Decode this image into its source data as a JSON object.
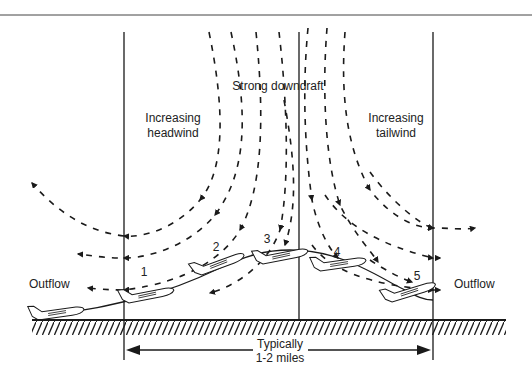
{
  "labels": {
    "title_center": "Strong downdraft",
    "left_zone_line1": "Increasing",
    "left_zone_line2": "headwind",
    "right_zone_line1": "Increasing",
    "right_zone_line2": "tailwind",
    "outflow_left": "Outflow",
    "outflow_right": "Outflow",
    "distance_line1": "Typically",
    "distance_line2": "1-2 miles"
  },
  "aircraft_positions": [
    "1",
    "2",
    "3",
    "4",
    "5"
  ],
  "colors": {
    "ink": "#1a1a1a",
    "background": "#ffffff"
  }
}
